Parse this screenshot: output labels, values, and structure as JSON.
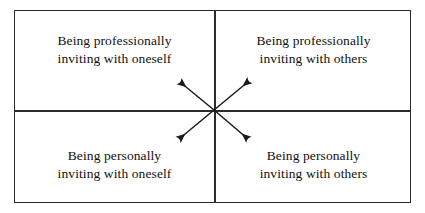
{
  "diagram": {
    "type": "2x2-matrix-with-diagonal-arrows",
    "background_color": "#ffffff",
    "border_color": "#2b2b2b",
    "text_color": "#111111",
    "quadrants": [
      {
        "id": "top-left",
        "label": "Being professionally\ninviting with oneself",
        "line1": "Being professionally",
        "line2": "inviting with oneself"
      },
      {
        "id": "top-right",
        "label": "Being professionally\ninviting with others",
        "line1": "Being professionally",
        "line2": "inviting with others"
      },
      {
        "id": "bottom-left",
        "label": "Being personally\ninviting with oneself",
        "line1": "Being personally",
        "line2": "inviting with oneself"
      },
      {
        "id": "bottom-right",
        "label": "Being personally\ninviting with others",
        "line1": "Being personally",
        "line2": "inviting with others"
      }
    ],
    "arrows": {
      "style": "solid-filled-arrowhead",
      "color": "#1a1a1a",
      "count": 4,
      "origin": "center-of-matrix",
      "directions": [
        "up-left",
        "up-right",
        "down-left",
        "down-right"
      ]
    }
  }
}
